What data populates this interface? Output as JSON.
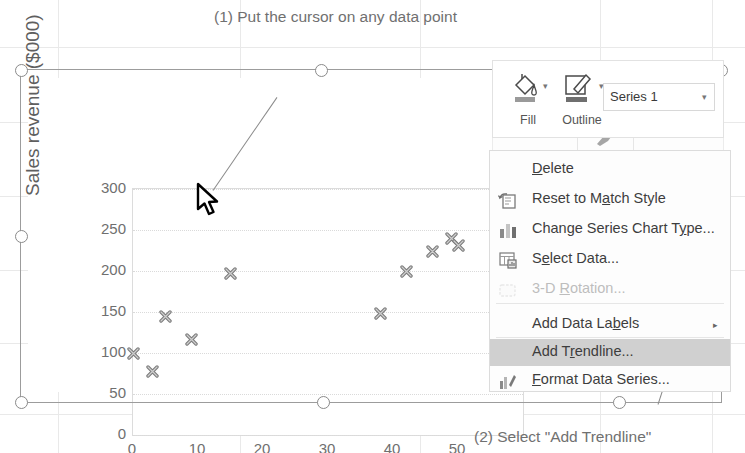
{
  "chart_data": {
    "type": "scatter",
    "title": "",
    "xlabel": "Expenditures ($000)",
    "ylabel": "Sales revenue ($000)",
    "xlim": [
      0,
      60
    ],
    "ylim": [
      0,
      300
    ],
    "xticks": [
      "0",
      "10",
      "20",
      "30",
      "40",
      "50"
    ],
    "yticks": [
      "0",
      "50",
      "100",
      "150",
      "200",
      "250",
      "300"
    ],
    "grid": "horizontal",
    "legend": "none",
    "series_name": "Series 1",
    "marker": "x-cross",
    "marker_color": "#7b7b7b",
    "points": [
      {
        "x": 0,
        "y": 100
      },
      {
        "x": 3,
        "y": 78
      },
      {
        "x": 5,
        "y": 145
      },
      {
        "x": 9,
        "y": 117
      },
      {
        "x": 15,
        "y": 197
      },
      {
        "x": 38,
        "y": 148
      },
      {
        "x": 42,
        "y": 199
      },
      {
        "x": 46,
        "y": 224
      },
      {
        "x": 49,
        "y": 240
      },
      {
        "x": 50,
        "y": 231
      },
      {
        "x": 56,
        "y": 251
      }
    ]
  },
  "callouts": {
    "step1": "(1) Put the cursor on any data point",
    "step2": "(2) Select \"Add Trendline\""
  },
  "mini_toolbar": {
    "fill_label": "Fill",
    "outline_label": "Outline",
    "fill_icon": "paint-bucket-icon",
    "outline_icon": "pencil-outline-icon",
    "series_selected": "Series 1",
    "dropdown_caret": "▾",
    "format_painter_icon": "format-painter-icon"
  },
  "context_menu": {
    "items": [
      {
        "label": "Delete",
        "accel": "D",
        "icon": null,
        "state": "normal",
        "submenu": false
      },
      {
        "label": "Reset to Match Style",
        "accel": "a",
        "icon": "reset-style-icon",
        "state": "normal",
        "submenu": false
      },
      {
        "label": "Change Series Chart Type...",
        "accel": "y",
        "icon": "chart-type-icon",
        "state": "normal",
        "submenu": false
      },
      {
        "label": "Select Data...",
        "accel": "e",
        "icon": "select-data-icon",
        "state": "normal",
        "submenu": false
      },
      {
        "label": "3-D Rotation...",
        "accel": "R",
        "icon": "rotation-3d-icon",
        "state": "disabled",
        "submenu": false
      },
      {
        "label": "Add Data Labels",
        "accel": "b",
        "icon": null,
        "state": "normal",
        "submenu": true
      },
      {
        "label": "Add Trendline...",
        "accel": "r",
        "icon": null,
        "state": "highlighted",
        "submenu": false
      },
      {
        "label": "Format Data Series...",
        "accel": "F",
        "icon": "format-series-icon",
        "state": "normal",
        "submenu": false
      }
    ],
    "submenu_arrow": "▸",
    "highlight_color": "#d0d0d0"
  },
  "selection": {
    "handle_count": 8,
    "handle_shape": "circle"
  }
}
